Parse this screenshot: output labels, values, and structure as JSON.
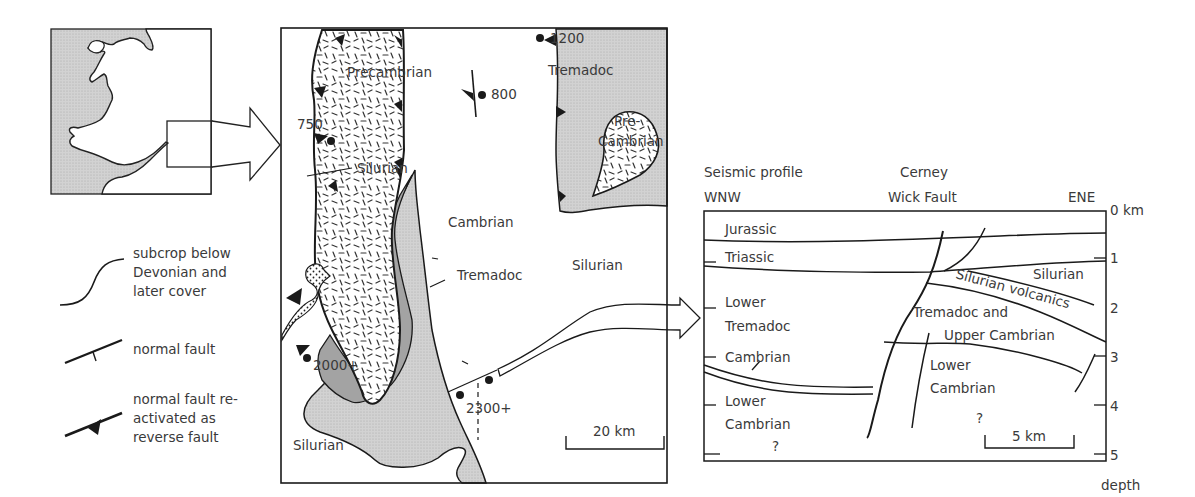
{
  "colors": {
    "light_grey": "#c9c9c9",
    "dark_grey": "#9a9a9a",
    "inset_sea": "#cfcfcf",
    "line": "#1a1a1a",
    "text": "#3a3a3a"
  },
  "inset_map": {
    "description": "Location map of Wales and the Bristol Channel with highlighted study area"
  },
  "legend": {
    "items": [
      {
        "symbol": "subcrop-line",
        "label_lines": [
          "subcrop below",
          "Devonian and",
          "later cover"
        ]
      },
      {
        "symbol": "normal-fault",
        "label_lines": [
          "normal fault"
        ]
      },
      {
        "symbol": "reactivated-reverse-fault",
        "label_lines": [
          "normal fault re-",
          "activated as",
          "reverse fault"
        ]
      }
    ]
  },
  "geologic_map": {
    "units": {
      "precambrian": "Precambrian",
      "pre_cambrian_east": [
        "Pre-",
        "Cambrian"
      ],
      "tremadoc_ne": "Tremadoc",
      "tremadoc_s": "Tremadoc",
      "cambrian": "Cambrian",
      "silurian_w": "Silurian",
      "silurian_e": "Silurian",
      "silurian_sw": "Silurian"
    },
    "wells": [
      {
        "label": "1200"
      },
      {
        "label": "800"
      },
      {
        "label": "750"
      },
      {
        "label": "2000+"
      },
      {
        "label": "2300+"
      }
    ],
    "scale_bar": "20 km"
  },
  "seismic_profile": {
    "title": "Seismic profile",
    "left_end": "WNW",
    "right_end": "ENE",
    "fault_name": [
      "Cerney",
      "Wick Fault"
    ],
    "depth_axis": {
      "ticks": [
        "0 km",
        "1",
        "2",
        "3",
        "4",
        "5"
      ],
      "label": "depth"
    },
    "units_left": {
      "jurassic": "Jurassic",
      "triassic": "Triassic",
      "lower_tremadoc": [
        "Lower",
        "Tremadoc"
      ],
      "cambrian": "Cambrian",
      "lower_cambrian": [
        "Lower",
        "Cambrian"
      ],
      "unknown": "?"
    },
    "units_right": {
      "silurian": "Silurian",
      "silurian_volcanics": "Silurian volcanics",
      "tremadoc_upper_cambrian": [
        "Tremadoc and",
        "Upper Cambrian"
      ],
      "lower_cambrian": [
        "Lower",
        "Cambrian"
      ],
      "unknown": "?"
    },
    "scale_bar": "5 km"
  }
}
